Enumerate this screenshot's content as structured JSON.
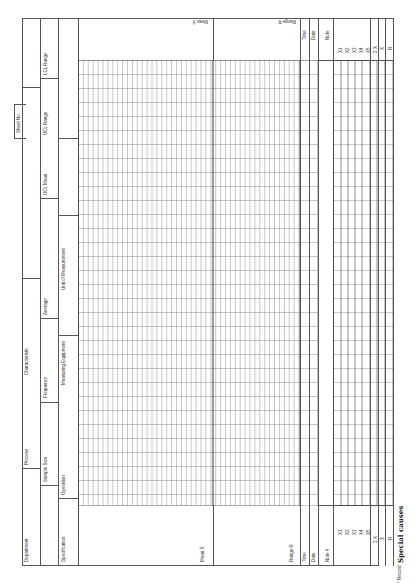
{
  "form": {
    "sheet_no": "Sheet No.",
    "header": {
      "department": "Department",
      "process": "Process",
      "characteristic": "Characteristic",
      "ucl_mean_top": "UCL Mean",
      "lcl_range_top": "LCL Range",
      "sample_size": "Sample Size",
      "frequency": "Frequency",
      "average": "Average",
      "lcl_mean": "LCL Mean",
      "ucl_range": "UCL Range",
      "lcl_range": "LCL Range",
      "specification": "Specification",
      "operation": "Operation",
      "measuring_equipment": "Measuring Equipment",
      "unit_of_measurement": "Unit of Measurement"
    },
    "chart_labels": {
      "mean_top": "Mean X̄",
      "range_top": "Range R",
      "mean_bottom": "Mean X̄",
      "range_bottom": "Range R"
    },
    "data_rows": {
      "time": "Time",
      "date": "Date",
      "note": "Note",
      "note_hash": "Note #",
      "x1": "X1",
      "x2": "X2",
      "x3": "X3",
      "x4": "X4",
      "x5": "X5",
      "sum_x": "Σ X",
      "x_bar": "X̄",
      "r": "R"
    },
    "footnote": "* Record",
    "handwritten": "Special causes"
  }
}
